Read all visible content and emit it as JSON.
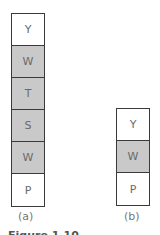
{
  "stack_a": {
    "cells": [
      {
        "label": "Y",
        "shade": "white"
      },
      {
        "label": "W",
        "shade": "gray"
      },
      {
        "label": "T",
        "shade": "gray"
      },
      {
        "label": "S",
        "shade": "gray"
      },
      {
        "label": "W",
        "shade": "gray"
      },
      {
        "label": "P",
        "shade": "white"
      }
    ],
    "caption": "(a)"
  },
  "stack_b": {
    "cells": [
      {
        "label": "Y",
        "shade": "white"
      },
      {
        "label": "W",
        "shade": "gray"
      },
      {
        "label": "P",
        "shade": "white"
      }
    ],
    "caption": "(b)"
  },
  "figure_caption": "Figure 1.10",
  "colors": {
    "gray": "#c9c9c9",
    "white": "#ffffff",
    "border": "#3a3a3a"
  }
}
